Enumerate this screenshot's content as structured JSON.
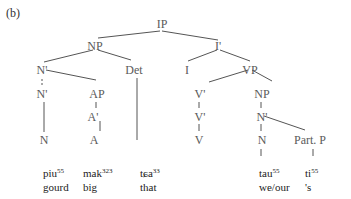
{
  "figure_label": "(b)",
  "tree": {
    "nodes": {
      "ip": "IP",
      "np_top": "NP",
      "ibar": "I'",
      "nbar1": "N'",
      "det": "Det",
      "i": "I",
      "vp": "VP",
      "nbar2": "N'",
      "ap": "AP",
      "vbar1": "V'",
      "np_obj": "NP",
      "abar": "A'",
      "vbar2": "V'",
      "nbar_obj": "N'",
      "n1": "N",
      "a": "A",
      "v": "V",
      "n2": "N",
      "partp": "Part. P"
    }
  },
  "words": [
    {
      "form": "piu",
      "tone": "55",
      "gloss": "gourd"
    },
    {
      "form": "mak",
      "tone": "323",
      "gloss": "big"
    },
    {
      "form": "tɕa",
      "tone": "33",
      "gloss": "that"
    },
    {
      "form": "tau",
      "tone": "55",
      "gloss": "we/our"
    },
    {
      "form": "ti",
      "tone": "55",
      "gloss": "'s"
    }
  ]
}
